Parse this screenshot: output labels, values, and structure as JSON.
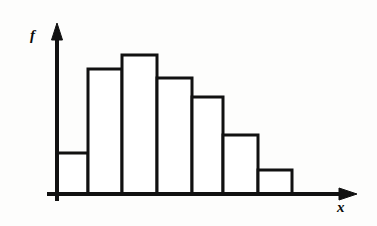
{
  "figure": {
    "title": "",
    "axis_labels": {
      "y": "f",
      "x": "x"
    },
    "style": {
      "background": "#fdfdfc",
      "ink": "#111111",
      "bar_fill": "#ffffff",
      "line_width": 3
    }
  },
  "chart_data": {
    "type": "bar",
    "title": "",
    "xlabel": "x",
    "ylabel": "f",
    "grid": false,
    "legend": false,
    "categories": [
      "1",
      "2",
      "3",
      "4",
      "5",
      "6",
      "7"
    ],
    "values": [
      41,
      125,
      139,
      116,
      97,
      59,
      24
    ],
    "ylim": [
      0,
      169
    ],
    "xlim": [
      0,
      7
    ],
    "bar_edges_px": [
      57,
      88,
      122,
      157,
      192,
      223,
      258,
      292
    ],
    "bar_tops_px": [
      153,
      69,
      55,
      78,
      97,
      135,
      170
    ],
    "baseline_px": 194
  },
  "geometry": {
    "y_axis": {
      "x": 57,
      "top": 25,
      "bottom": 201
    },
    "x_axis": {
      "y": 194,
      "left": 47,
      "right": 356
    }
  }
}
